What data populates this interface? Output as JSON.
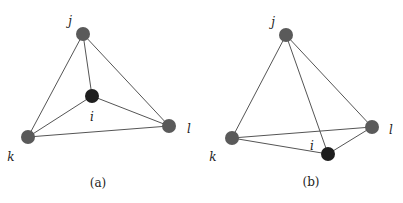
{
  "figure": {
    "panels": [
      {
        "id": "a",
        "caption": "(a)",
        "caption_pos": [
          98,
          187
        ],
        "nodes": {
          "j": {
            "label": "j",
            "x": 83,
            "y": 34,
            "label_x": 70,
            "label_y": 25,
            "color": "#5a5a5a"
          },
          "i": {
            "label": "i",
            "x": 92,
            "y": 96,
            "label_x": 92,
            "label_y": 121,
            "color": "#1e1e1e"
          },
          "k": {
            "label": "k",
            "x": 28,
            "y": 137,
            "label_x": 11,
            "label_y": 161,
            "color": "#5a5a5a"
          },
          "l": {
            "label": "l",
            "x": 169,
            "y": 126,
            "label_x": 189,
            "label_y": 133,
            "color": "#5a5a5a"
          }
        },
        "edges": [
          [
            "j",
            "k"
          ],
          [
            "j",
            "l"
          ],
          [
            "j",
            "i"
          ],
          [
            "i",
            "k"
          ],
          [
            "i",
            "l"
          ],
          [
            "k",
            "l"
          ]
        ]
      },
      {
        "id": "b",
        "caption": "(b)",
        "caption_pos": [
          311,
          186
        ],
        "nodes": {
          "j": {
            "label": "j",
            "x": 286,
            "y": 35,
            "label_x": 273,
            "label_y": 26,
            "color": "#5a5a5a"
          },
          "i": {
            "label": "i",
            "x": 328,
            "y": 154,
            "label_x": 312,
            "label_y": 150,
            "color": "#1e1e1e"
          },
          "k": {
            "label": "k",
            "x": 232,
            "y": 138,
            "label_x": 213,
            "label_y": 161,
            "color": "#5a5a5a"
          },
          "l": {
            "label": "l",
            "x": 372,
            "y": 127,
            "label_x": 391,
            "label_y": 134,
            "color": "#5a5a5a"
          }
        },
        "edges": [
          [
            "j",
            "k"
          ],
          [
            "j",
            "l"
          ],
          [
            "j",
            "i"
          ],
          [
            "i",
            "k"
          ],
          [
            "i",
            "l"
          ],
          [
            "k",
            "l"
          ]
        ]
      }
    ],
    "node_radius": 7,
    "edge_color": "#555555"
  }
}
